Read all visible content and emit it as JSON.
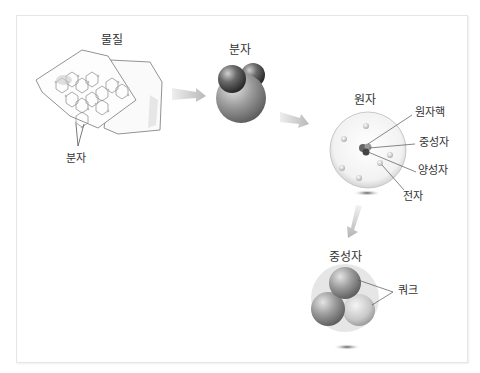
{
  "diagram": {
    "stages": [
      {
        "id": "matter",
        "label": "물질",
        "sublabel": "분자"
      },
      {
        "id": "molecule",
        "label": "분자"
      },
      {
        "id": "atom",
        "label": "원자",
        "parts": [
          "원자핵",
          "중성자",
          "양성자",
          "전자"
        ]
      },
      {
        "id": "neutron",
        "label": "중성자",
        "parts": [
          "쿼크"
        ]
      }
    ],
    "colors": {
      "frame_border": "#e6e6e6",
      "arrow": "#c8c8c8",
      "text": "#333333",
      "sphere_dark": "#555555",
      "sphere_mid": "#9a9a9a",
      "sphere_light": "#d8d8d8"
    }
  }
}
